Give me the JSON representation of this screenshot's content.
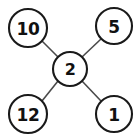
{
  "diagram": {
    "type": "star-graph",
    "background_color": "#ffffff",
    "node_fill_color": "#ffffff",
    "node_stroke_color": "#1a1a1a",
    "edge_color": "#4a4a4a",
    "label_color": "#111111",
    "center_node": {
      "id": "center",
      "label": "2",
      "cx": 70,
      "cy": 69,
      "rx": 17,
      "ry": 17
    },
    "outer_nodes": [
      {
        "id": "top-left",
        "label": "10",
        "cx": 28,
        "cy": 28,
        "rx": 19,
        "ry": 19
      },
      {
        "id": "top-right",
        "label": "5",
        "cx": 114,
        "cy": 26,
        "rx": 18,
        "ry": 18
      },
      {
        "id": "bottom-left",
        "label": "12",
        "cx": 28,
        "cy": 114,
        "rx": 19,
        "ry": 19
      },
      {
        "id": "bottom-right",
        "label": "1",
        "cx": 114,
        "cy": 114,
        "rx": 18,
        "ry": 18
      }
    ],
    "edges": [
      {
        "id": "edge-center-top-left",
        "from": "center",
        "to": "top-left",
        "x1": 58,
        "y1": 57,
        "x2": 42,
        "y2": 41
      },
      {
        "id": "edge-center-top-right",
        "from": "center",
        "to": "top-right",
        "x1": 82,
        "y1": 57,
        "x2": 101,
        "y2": 39
      },
      {
        "id": "edge-center-bottom-left",
        "from": "center",
        "to": "bottom-left",
        "x1": 58,
        "y1": 81,
        "x2": 42,
        "y2": 101
      },
      {
        "id": "edge-center-bottom-right",
        "from": "center",
        "to": "bottom-right",
        "x1": 82,
        "y1": 81,
        "x2": 101,
        "y2": 101
      }
    ]
  }
}
